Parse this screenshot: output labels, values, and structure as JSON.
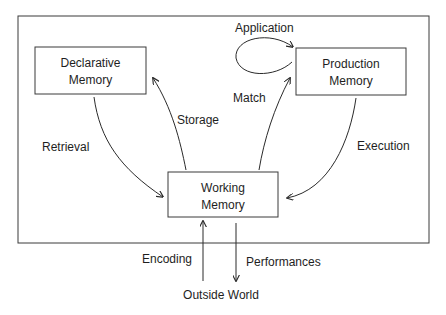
{
  "diagram": {
    "nodes": {
      "declarative": {
        "line1": "Declarative",
        "line2": "Memory"
      },
      "production": {
        "line1": "Production",
        "line2": "Memory"
      },
      "working": {
        "line1": "Working",
        "line2": "Memory"
      }
    },
    "edges": {
      "application": "Application",
      "storage": "Storage",
      "match": "Match",
      "retrieval": "Retrieval",
      "execution": "Execution",
      "encoding": "Encoding",
      "performances": "Performances"
    },
    "external": {
      "outside_world": "Outside World"
    }
  }
}
